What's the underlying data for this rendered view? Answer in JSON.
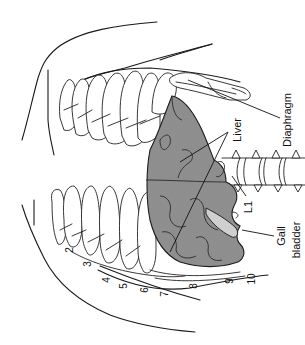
{
  "figure": {
    "orientation_deg": -90,
    "colors": {
      "background": "#ffffff",
      "line": "#1a1a1a",
      "liver_fill": "#8f8f8f",
      "gallbladder_fill": "#cfcfcf"
    }
  },
  "labels": {
    "diaphragm": "Diaphragm",
    "liver": "Liver",
    "l1": "L1",
    "gall": "Gall",
    "bladder": "bladder"
  },
  "rib_numbers": [
    "2",
    "3",
    "4",
    "5",
    "6",
    "7",
    "8",
    "9",
    "10"
  ]
}
